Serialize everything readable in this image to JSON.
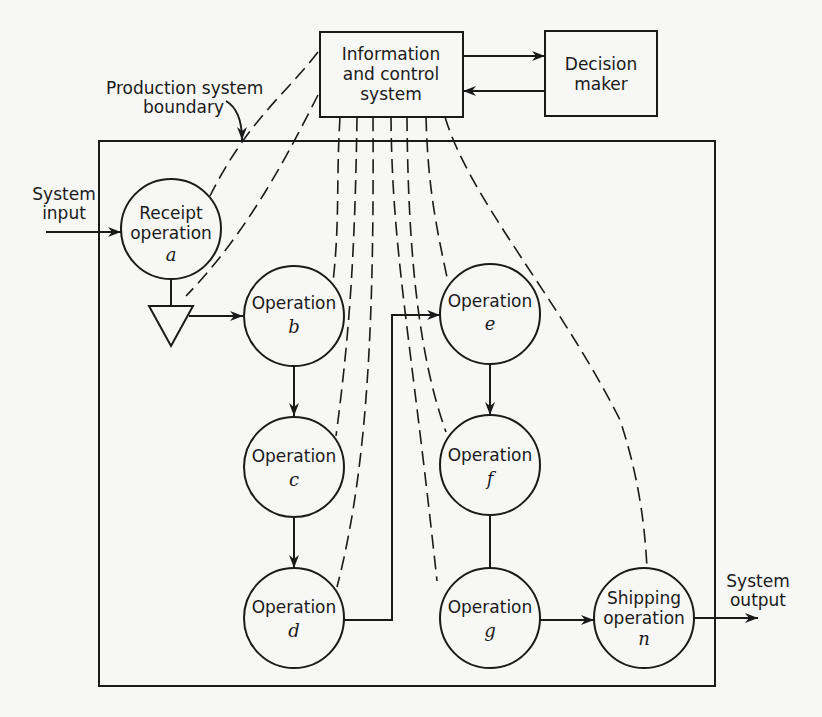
{
  "diagram": {
    "type": "production system flow diagram",
    "boxes": {
      "info": {
        "line1": "Information",
        "line2": "and control",
        "line3": "system"
      },
      "decision": {
        "line1": "Decision",
        "line2": "maker"
      }
    },
    "labels": {
      "boundary_line1": "Production system",
      "boundary_line2": "boundary",
      "input_line1": "System",
      "input_line2": "input",
      "output_line1": "System",
      "output_line2": "output"
    },
    "nodes": [
      {
        "id": "a",
        "line1": "Receipt",
        "line2": "operation",
        "letter": "a"
      },
      {
        "id": "b",
        "line1": "Operation",
        "letter": "b"
      },
      {
        "id": "c",
        "line1": "Operation",
        "letter": "c"
      },
      {
        "id": "d",
        "line1": "Operation",
        "letter": "d"
      },
      {
        "id": "e",
        "line1": "Operation",
        "letter": "e"
      },
      {
        "id": "f",
        "line1": "Operation",
        "letter": "f"
      },
      {
        "id": "g",
        "line1": "Operation",
        "letter": "g"
      },
      {
        "id": "n",
        "line1": "Shipping",
        "line2": "operation",
        "letter": "n"
      }
    ],
    "flows": [
      [
        "input",
        "a"
      ],
      [
        "a",
        "storage"
      ],
      [
        "storage",
        "b"
      ],
      [
        "b",
        "c"
      ],
      [
        "c",
        "d"
      ],
      [
        "d",
        "e"
      ],
      [
        "e",
        "f"
      ],
      [
        "f",
        "g"
      ],
      [
        "g",
        "n"
      ],
      [
        "n",
        "output"
      ],
      [
        "info",
        "decision"
      ],
      [
        "decision",
        "info"
      ]
    ],
    "colors": {
      "ink": "#1a1a1a",
      "paper": "#f7f7f5"
    }
  }
}
